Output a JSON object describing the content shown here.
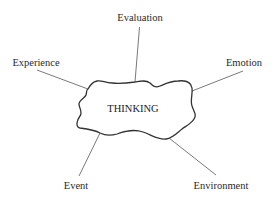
{
  "diagram": {
    "center": {
      "label": "THINKING",
      "shape": "irregular-cloud"
    },
    "nodes": [
      {
        "id": "evaluation",
        "label": "Evaluation"
      },
      {
        "id": "experience",
        "label": "Experience"
      },
      {
        "id": "emotion",
        "label": "Emotion"
      },
      {
        "id": "event",
        "label": "Event"
      },
      {
        "id": "environment",
        "label": "Environment"
      }
    ],
    "edges": [
      {
        "from": "THINKING",
        "to": "Evaluation"
      },
      {
        "from": "THINKING",
        "to": "Experience"
      },
      {
        "from": "THINKING",
        "to": "Emotion"
      },
      {
        "from": "THINKING",
        "to": "Event"
      },
      {
        "from": "THINKING",
        "to": "Environment"
      }
    ],
    "colors": {
      "background": "#ffffff",
      "outline": "#333333",
      "spoke": "#6a6a6a",
      "text": "#2a2a2a"
    }
  }
}
